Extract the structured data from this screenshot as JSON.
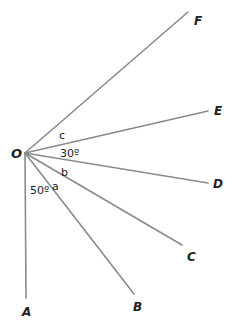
{
  "diagram": {
    "type": "angles-at-a-point",
    "origin": {
      "label": "O",
      "x": 25,
      "y": 153
    },
    "rays": [
      {
        "label": "A",
        "end": [
          26,
          298
        ],
        "label_pos": [
          22,
          316
        ]
      },
      {
        "label": "B",
        "end": [
          134,
          294
        ],
        "label_pos": [
          133,
          311
        ]
      },
      {
        "label": "C",
        "end": [
          182,
          245
        ],
        "label_pos": [
          187,
          261
        ]
      },
      {
        "label": "D",
        "end": [
          208,
          183
        ],
        "label_pos": [
          213,
          188
        ]
      },
      {
        "label": "E",
        "end": [
          208,
          111
        ],
        "label_pos": [
          214,
          115
        ]
      },
      {
        "label": "F",
        "end": [
          188,
          12
        ],
        "label_pos": [
          194,
          25
        ]
      }
    ],
    "angle_labels": [
      {
        "text": "c",
        "x": 59,
        "y": 139
      },
      {
        "text": "30º",
        "x": 60,
        "y": 157
      },
      {
        "text": "b",
        "x": 61,
        "y": 176
      },
      {
        "text": "a",
        "x": 52,
        "y": 190
      },
      {
        "text": "50º",
        "x": 30,
        "y": 194
      }
    ],
    "colors": {
      "line": "#8a8a8a",
      "text": "#222222",
      "background": "#ffffff"
    }
  }
}
